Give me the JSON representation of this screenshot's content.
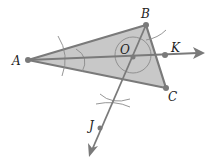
{
  "diagram": {
    "colors": {
      "fill": "#c8c8c8",
      "stroke": "#7a7a7a",
      "arc": "#8a8a8a",
      "text": "#222222"
    },
    "points": {
      "A": {
        "label": "A",
        "x": 28,
        "y": 60
      },
      "B": {
        "label": "B",
        "x": 146,
        "y": 25
      },
      "C": {
        "label": "C",
        "x": 166,
        "y": 88
      },
      "O": {
        "label": "O",
        "x": 133,
        "y": 57
      },
      "K": {
        "label": "K",
        "x": 165,
        "y": 55
      },
      "J": {
        "label": "J",
        "x": 100,
        "y": 128
      }
    },
    "rays": [
      {
        "name": "ray-AK",
        "from": "A",
        "through": "K"
      },
      {
        "name": "ray-BJ",
        "from": "B",
        "through": "J"
      }
    ]
  }
}
